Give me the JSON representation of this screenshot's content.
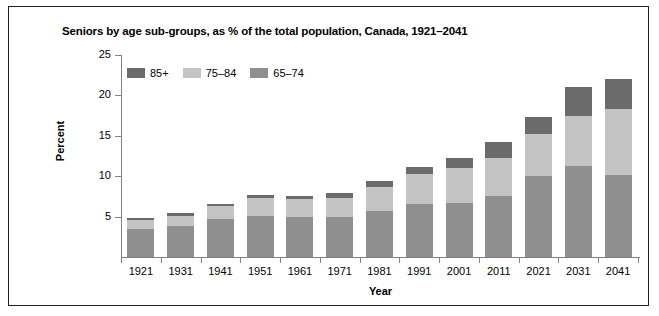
{
  "figure": {
    "title": "Seniors by age sub-groups, as % of the total population, Canada, 1921–2041"
  },
  "axes": {
    "y_title": "Percent",
    "x_title": "Year",
    "y_ticks": [
      "5",
      "10",
      "15",
      "20",
      "25"
    ]
  },
  "legend": {
    "items": [
      {
        "label": "85+",
        "color": "#6b6b6b"
      },
      {
        "label": "75–84",
        "color": "#c4c4c4"
      },
      {
        "label": "65–74",
        "color": "#8f8f8f"
      }
    ]
  },
  "chart_data": {
    "type": "bar",
    "title": "Seniors by age sub-groups, as % of the total population, Canada, 1921–2041",
    "xlabel": "Year",
    "ylabel": "Percent",
    "ylim": [
      0,
      25
    ],
    "yticks": [
      5,
      10,
      15,
      20,
      25
    ],
    "grid": false,
    "stacked": true,
    "legend_position": "top-left inside plot",
    "categories": [
      "1921",
      "1931",
      "1941",
      "1951",
      "1961",
      "1971",
      "1981",
      "1991",
      "2001",
      "2011",
      "2021",
      "2031",
      "2041"
    ],
    "series": [
      {
        "name": "65–74",
        "color": "#8f8f8f",
        "values": [
          3.5,
          3.9,
          4.7,
          5.1,
          4.9,
          4.9,
          5.7,
          6.6,
          6.7,
          7.5,
          10.0,
          11.3,
          10.1
        ]
      },
      {
        "name": "75–84",
        "color": "#c4c4c4",
        "values": [
          1.1,
          1.2,
          1.6,
          2.2,
          2.3,
          2.4,
          3.0,
          3.7,
          4.3,
          4.8,
          5.2,
          6.2,
          8.2
        ]
      },
      {
        "name": "85+",
        "color": "#6b6b6b",
        "values": [
          0.2,
          0.3,
          0.3,
          0.4,
          0.4,
          0.6,
          0.7,
          0.9,
          1.2,
          1.9,
          2.1,
          3.5,
          3.7
        ]
      }
    ],
    "totals": [
      4.8,
      5.4,
      6.6,
      7.7,
      7.6,
      7.9,
      9.4,
      11.2,
      12.2,
      14.2,
      17.3,
      21.0,
      22.0
    ]
  }
}
